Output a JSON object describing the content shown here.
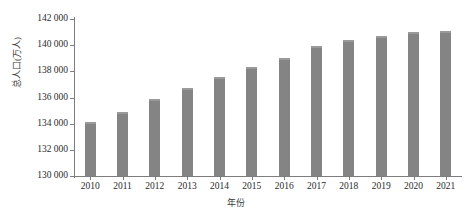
{
  "chart_data": {
    "type": "bar",
    "title": "",
    "xlabel": "年份",
    "ylabel": "总人口(万人)",
    "categories": [
      "2010",
      "2011",
      "2012",
      "2013",
      "2014",
      "2015",
      "2016",
      "2017",
      "2018",
      "2019",
      "2020",
      "2021"
    ],
    "values": [
      134100,
      134900,
      135900,
      136700,
      137600,
      138300,
      139000,
      139900,
      140400,
      140700,
      141000,
      141100
    ],
    "ylim": [
      130000,
      142000
    ],
    "ytick_values": [
      130000,
      132000,
      134000,
      136000,
      138000,
      140000,
      142000
    ],
    "ytick_labels": [
      "130 000",
      "132 000",
      "134 000",
      "136 000",
      "138 000",
      "140 000",
      "142 000"
    ],
    "grid": false,
    "legend": false,
    "series_color": "#848484",
    "axis_color": "#7d7d7d",
    "background": "#ffffff"
  }
}
